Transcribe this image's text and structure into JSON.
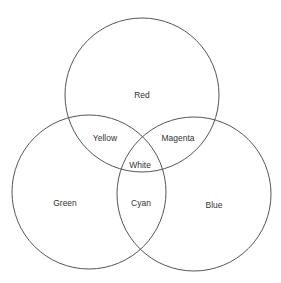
{
  "diagram": {
    "type": "venn",
    "stroke_color": "#555555",
    "circles": [
      {
        "name": "Red",
        "cx": 142,
        "cy": 95,
        "r": 77
      },
      {
        "name": "Green",
        "cx": 89,
        "cy": 192,
        "r": 77
      },
      {
        "name": "Blue",
        "cx": 194,
        "cy": 194,
        "r": 77
      }
    ],
    "labels": {
      "red": "Red",
      "green": "Green",
      "blue": "Blue",
      "yellow": "Yellow",
      "magenta": "Magenta",
      "cyan": "Cyan",
      "white": "White"
    }
  }
}
